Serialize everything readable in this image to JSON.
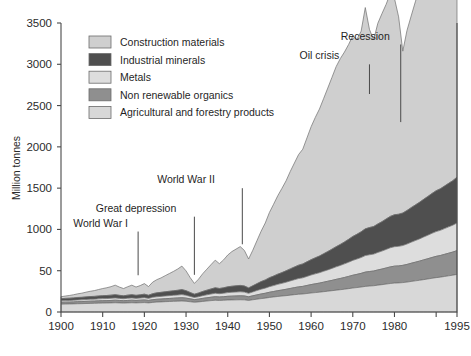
{
  "chart_data": {
    "type": "area",
    "stacked": true,
    "title": "",
    "subtitle": "",
    "xlabel": "",
    "ylabel": "Million tonnes",
    "xlim": [
      1900,
      1995
    ],
    "ylim": [
      0,
      3500
    ],
    "grid": false,
    "legend_position": "top-left",
    "y_ticks": [
      0,
      50,
      1000,
      1500,
      2000,
      2500,
      3000,
      3500
    ],
    "y_tick_labels": [
      "0",
      "50",
      "1000",
      "1500",
      "2000",
      "2500",
      "3000",
      "3500"
    ],
    "y_tick_values_actual": [
      0,
      500,
      1000,
      1500,
      2000,
      2500,
      3000,
      3500
    ],
    "x_ticks": [
      1900,
      1910,
      1920,
      1930,
      1940,
      1950,
      1960,
      1970,
      1980,
      1990,
      1995
    ],
    "x_tick_labels": [
      "1900",
      "1910",
      "1920",
      "1930",
      "1940",
      "1950",
      "1960",
      "1970",
      "1980",
      "",
      "1995"
    ],
    "x": [
      1900,
      1901,
      1902,
      1903,
      1904,
      1905,
      1906,
      1907,
      1908,
      1909,
      1910,
      1911,
      1912,
      1913,
      1914,
      1915,
      1916,
      1917,
      1918,
      1919,
      1920,
      1921,
      1922,
      1923,
      1924,
      1925,
      1926,
      1927,
      1928,
      1929,
      1930,
      1931,
      1932,
      1933,
      1934,
      1935,
      1936,
      1937,
      1938,
      1939,
      1940,
      1941,
      1942,
      1943,
      1944,
      1945,
      1946,
      1947,
      1948,
      1949,
      1950,
      1951,
      1952,
      1953,
      1954,
      1955,
      1956,
      1957,
      1958,
      1959,
      1960,
      1961,
      1962,
      1963,
      1964,
      1965,
      1966,
      1967,
      1968,
      1969,
      1970,
      1971,
      1972,
      1973,
      1974,
      1975,
      1976,
      1977,
      1978,
      1979,
      1980,
      1981,
      1982,
      1983,
      1984,
      1985,
      1986,
      1987,
      1988,
      1989,
      1990,
      1991,
      1992,
      1993,
      1994,
      1995
    ],
    "series": [
      {
        "name": "Agricultural and forestry products",
        "color": "#d8d8d8",
        "values": [
          95,
          96,
          97,
          98,
          100,
          101,
          103,
          104,
          105,
          107,
          108,
          109,
          110,
          112,
          110,
          108,
          110,
          112,
          110,
          112,
          114,
          110,
          116,
          120,
          122,
          125,
          127,
          129,
          131,
          133,
          130,
          124,
          118,
          122,
          128,
          133,
          138,
          142,
          140,
          142,
          145,
          146,
          147,
          148,
          147,
          140,
          148,
          155,
          162,
          168,
          176,
          182,
          188,
          193,
          198,
          204,
          210,
          215,
          218,
          224,
          230,
          235,
          240,
          246,
          252,
          258,
          264,
          270,
          276,
          283,
          290,
          296,
          302,
          310,
          314,
          318,
          325,
          331,
          338,
          345,
          350,
          352,
          356,
          362,
          370,
          377,
          384,
          392,
          400,
          408,
          416,
          422,
          430,
          438,
          446,
          455
        ]
      },
      {
        "name": "Non renewable organics",
        "color": "#8f8f8f",
        "values": [
          22,
          23,
          23,
          24,
          25,
          25,
          26,
          27,
          27,
          28,
          29,
          29,
          30,
          31,
          30,
          29,
          30,
          31,
          30,
          31,
          32,
          30,
          33,
          34,
          35,
          36,
          37,
          38,
          39,
          40,
          38,
          35,
          32,
          34,
          37,
          39,
          41,
          43,
          42,
          43,
          45,
          46,
          47,
          48,
          47,
          44,
          48,
          52,
          56,
          59,
          63,
          66,
          70,
          73,
          77,
          81,
          85,
          89,
          92,
          97,
          102,
          106,
          110,
          115,
          120,
          125,
          131,
          136,
          142,
          148,
          155,
          160,
          166,
          173,
          176,
          178,
          184,
          189,
          195,
          201,
          205,
          206,
          209,
          214,
          220,
          226,
          232,
          239,
          245,
          252,
          258,
          262,
          268,
          274,
          280,
          288
        ]
      },
      {
        "name": "Metals",
        "color": "#dddddd",
        "values": [
          18,
          19,
          19,
          20,
          21,
          21,
          22,
          23,
          23,
          24,
          25,
          25,
          26,
          27,
          25,
          24,
          26,
          27,
          25,
          26,
          28,
          25,
          29,
          31,
          32,
          33,
          34,
          35,
          36,
          38,
          35,
          30,
          26,
          29,
          33,
          36,
          39,
          42,
          40,
          42,
          45,
          47,
          48,
          49,
          47,
          42,
          47,
          53,
          58,
          62,
          68,
          72,
          77,
          81,
          86,
          91,
          96,
          101,
          104,
          110,
          116,
          121,
          126,
          132,
          138,
          145,
          152,
          158,
          165,
          172,
          180,
          186,
          192,
          200,
          203,
          205,
          212,
          218,
          225,
          232,
          236,
          237,
          240,
          247,
          255,
          262,
          269,
          277,
          285,
          293,
          300,
          305,
          312,
          319,
          326,
          335
        ]
      },
      {
        "name": "Industrial minerals",
        "color": "#4f4f4f",
        "values": [
          26,
          27,
          28,
          29,
          30,
          31,
          32,
          33,
          34,
          35,
          36,
          37,
          38,
          40,
          37,
          35,
          38,
          40,
          37,
          39,
          42,
          38,
          44,
          47,
          49,
          51,
          53,
          55,
          57,
          60,
          55,
          47,
          40,
          45,
          51,
          56,
          61,
          66,
          63,
          66,
          70,
          73,
          75,
          77,
          74,
          66,
          74,
          83,
          92,
          99,
          108,
          115,
          123,
          130,
          138,
          146,
          154,
          162,
          168,
          177,
          186,
          194,
          202,
          212,
          222,
          233,
          244,
          254,
          265,
          277,
          290,
          300,
          311,
          324,
          330,
          334,
          345,
          356,
          368,
          380,
          387,
          389,
          394,
          406,
          419,
          431,
          443,
          456,
          469,
          482,
          495,
          503,
          515,
          527,
          539,
          555
        ]
      },
      {
        "name": "Construction materials",
        "color": "#cfcfcf",
        "values": [
          24,
          28,
          33,
          38,
          44,
          50,
          57,
          64,
          70,
          78,
          86,
          94,
          103,
          115,
          100,
          88,
          102,
          115,
          100,
          112,
          128,
          105,
          140,
          160,
          175,
          195,
          215,
          235,
          258,
          285,
          240,
          180,
          130,
          168,
          215,
          255,
          295,
          335,
          300,
          338,
          385,
          420,
          445,
          470,
          430,
          350,
          430,
          520,
          610,
          690,
          790,
          870,
          950,
          1020,
          1090,
          1180,
          1260,
          1340,
          1390,
          1500,
          1610,
          1700,
          1780,
          1880,
          1980,
          2080,
          2180,
          2250,
          2300,
          2360,
          2430,
          2360,
          2430,
          2680,
          2400,
          2260,
          2430,
          2520,
          2600,
          2700,
          2620,
          2390,
          1960,
          2180,
          2320,
          2460,
          2590,
          2680,
          2760,
          2700,
          2620,
          2680,
          2780,
          2900,
          3010,
          3110
        ]
      }
    ],
    "peak_total_1995": 3150,
    "annotations": [
      {
        "label": "World War I",
        "x_text": 1909.5,
        "y_text": 1035,
        "x_point": 1918.5,
        "y_point": 445
      },
      {
        "label": "Great depression",
        "x_text": 1918.0,
        "y_text": 1215,
        "x_point": 1932.0,
        "y_point": 450
      },
      {
        "label": "World War II",
        "x_text": 1930.0,
        "y_text": 1560,
        "x_point": 1943.5,
        "y_point": 820
      },
      {
        "label": "Oil crisis",
        "x_text": 1962.0,
        "y_text": 3060,
        "x_point": 1974.0,
        "y_point": 2640
      },
      {
        "label": "Recession",
        "x_text": 1973.0,
        "y_text": 3300,
        "x_point": 1981.5,
        "y_point": 2300
      }
    ]
  },
  "legend": {
    "items": [
      {
        "label": "Construction materials",
        "color": "#cfcfcf"
      },
      {
        "label": "Industrial minerals",
        "color": "#4f4f4f"
      },
      {
        "label": "Metals",
        "color": "#dddddd"
      },
      {
        "label": "Non renewable organics",
        "color": "#8f8f8f"
      },
      {
        "label": "Agricultural and forestry products",
        "color": "#d8d8d8"
      }
    ]
  },
  "axis": {
    "y_title": "Million tonnes"
  }
}
